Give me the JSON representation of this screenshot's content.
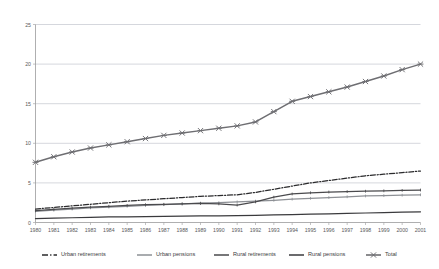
{
  "chart_data": {
    "type": "line",
    "title": "",
    "subtitle": "",
    "xlabel": "",
    "ylabel": "",
    "xlim": [
      1980,
      2001
    ],
    "ylim": [
      0,
      25
    ],
    "yticks": [
      0,
      5,
      10,
      15,
      20,
      25
    ],
    "grid": true,
    "legend_position": "bottom",
    "x": [
      1980,
      1981,
      1982,
      1983,
      1984,
      1985,
      1986,
      1987,
      1988,
      1989,
      1990,
      1991,
      1992,
      1993,
      1994,
      1995,
      1996,
      1997,
      1998,
      1999,
      2000,
      2001
    ],
    "categories": [
      "1980",
      "1981",
      "1982",
      "1983",
      "1984",
      "1985",
      "1986",
      "1987",
      "1988",
      "1989",
      "1990",
      "1991",
      "1992",
      "1993",
      "1994",
      "1995",
      "1996",
      "1997",
      "1998",
      "1999",
      "2000",
      "2001"
    ],
    "series": [
      {
        "name": "Urban retirements",
        "color": "#2b2b2d",
        "style": "dash-dot",
        "marker": "none",
        "values": [
          1.7,
          1.9,
          2.1,
          2.3,
          2.5,
          2.7,
          2.85,
          3.0,
          3.15,
          3.3,
          3.4,
          3.5,
          3.8,
          4.2,
          4.6,
          5.0,
          5.3,
          5.6,
          5.9,
          6.1,
          6.3,
          6.5
        ]
      },
      {
        "name": "Urban pensions",
        "color": "#8d9095",
        "style": "solid",
        "marker": "tick",
        "values": [
          1.4,
          1.55,
          1.7,
          1.85,
          1.95,
          2.05,
          2.15,
          2.25,
          2.35,
          2.45,
          2.5,
          2.6,
          2.7,
          2.8,
          2.95,
          3.05,
          3.15,
          3.25,
          3.35,
          3.4,
          3.45,
          3.5
        ]
      },
      {
        "name": "Rural  retirements",
        "color": "#4a4a4d",
        "style": "solid",
        "marker": "tick",
        "values": [
          1.5,
          1.65,
          1.8,
          1.95,
          2.05,
          2.15,
          2.25,
          2.3,
          2.35,
          2.4,
          2.35,
          2.2,
          2.6,
          3.2,
          3.6,
          3.75,
          3.85,
          3.9,
          3.95,
          4.0,
          4.05,
          4.1
        ]
      },
      {
        "name": "Rural pensions",
        "color": "#3a3a3d",
        "style": "solid",
        "marker": "none",
        "values": [
          0.5,
          0.55,
          0.6,
          0.65,
          0.7,
          0.72,
          0.75,
          0.78,
          0.8,
          0.83,
          0.85,
          0.88,
          0.9,
          0.95,
          1.0,
          1.05,
          1.1,
          1.15,
          1.2,
          1.25,
          1.3,
          1.35
        ]
      },
      {
        "name": "Total",
        "color": "#6e6e72",
        "style": "solid",
        "marker": "x",
        "values": [
          7.6,
          8.3,
          8.9,
          9.4,
          9.8,
          10.2,
          10.6,
          11.0,
          11.3,
          11.6,
          11.9,
          12.2,
          12.7,
          14.0,
          15.3,
          15.9,
          16.5,
          17.1,
          17.8,
          18.5,
          19.3,
          20.0
        ]
      }
    ]
  },
  "legend": {
    "items": [
      {
        "label": "Urban retirements"
      },
      {
        "label": "Urban pensions"
      },
      {
        "label": "Rural  retirements"
      },
      {
        "label": "Rural pensions"
      },
      {
        "label": "Total"
      }
    ]
  }
}
